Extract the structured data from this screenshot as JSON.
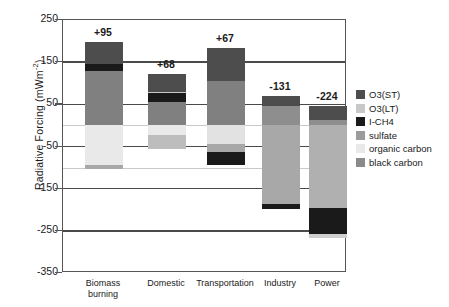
{
  "chart_data": {
    "type": "bar",
    "subtype": "stacked-bar-diverging",
    "title": "",
    "xlabel": "",
    "ylabel": "Radiative Forcing (mWm-2)",
    "ylabel_base": "Radiative Forcing (mWm",
    "ylabel_sup": "-2",
    "ylabel_close": ")",
    "ylim": [
      -350,
      250
    ],
    "yticks": [
      250,
      150,
      50,
      -50,
      -150,
      -250,
      -350
    ],
    "ytick_labels": [
      "250",
      "150",
      "50",
      "-50",
      "-150",
      "-250",
      "-350"
    ],
    "grid": "horizontal-major-and-minor",
    "legend_position": "right",
    "categories": [
      "Biomass burning",
      "Domestic",
      "Transportation",
      "Industry",
      "Power"
    ],
    "category_labels_line1": [
      "Biomass",
      "Domestic",
      "Transportation",
      "Industry",
      "Power"
    ],
    "category_labels_line2": [
      "burning",
      "",
      "",
      "",
      ""
    ],
    "net_labels": [
      "+95",
      "+68",
      "+67",
      "-131",
      "-224"
    ],
    "net_values": [
      95,
      68,
      67,
      -131,
      -224
    ],
    "series": [
      {
        "name": "O3(ST)",
        "color": "#4d4d4d",
        "values": [
          52,
          44,
          77,
          25,
          35
        ]
      },
      {
        "name": "O3(LT)",
        "color": "#c8c8c8",
        "values": [
          0,
          4,
          0,
          0,
          0
        ]
      },
      {
        "name": "I-CH4",
        "color": "#1a1a1a",
        "values": [
          17,
          22,
          -50,
          -9,
          -64
        ]
      },
      {
        "name": "sulfate",
        "color": "#9b9b9b",
        "values": [
          0,
          0,
          -18,
          -168,
          -200
        ]
      },
      {
        "name": "organic carbon",
        "color": "#e2e2e2",
        "values": [
          -105,
          -55,
          -45,
          0,
          -10
        ]
      },
      {
        "name": "black carbon",
        "color": "#808080",
        "values": [
          131,
          53,
          103,
          21,
          15
        ]
      }
    ],
    "legend_entries": [
      {
        "label": "O3(ST)",
        "color": "#4d4d4d"
      },
      {
        "label": "O3(LT)",
        "color": "#c8c8c8"
      },
      {
        "label": "I-CH4",
        "color": "#1a1a1a"
      },
      {
        "label": "sulfate",
        "color": "#9b9b9b"
      },
      {
        "label": "organic carbon",
        "color": "#e9e9e9"
      },
      {
        "label": "black carbon",
        "color": "#8a8a8a"
      }
    ],
    "bars": [
      {
        "category": "Biomass burning",
        "net_label": "+95",
        "pos_segments": [
          {
            "name": "black carbon",
            "color": "#808080",
            "from": 0,
            "to": 128
          },
          {
            "name": "I-CH4",
            "color": "#1a1a1a",
            "from": 128,
            "to": 145
          },
          {
            "name": "O3(ST)",
            "color": "#4d4d4d",
            "from": 145,
            "to": 198
          }
        ],
        "neg_segments": [
          {
            "name": "organic carbon",
            "color": "#e9e9e9",
            "from": 0,
            "to": -95
          },
          {
            "name": "sulfate",
            "color": "#a8a8a8",
            "from": -95,
            "to": -103
          }
        ]
      },
      {
        "category": "Domestic",
        "net_label": "+68",
        "pos_segments": [
          {
            "name": "black carbon",
            "color": "#808080",
            "from": 0,
            "to": 55
          },
          {
            "name": "I-CH4",
            "color": "#1a1a1a",
            "from": 55,
            "to": 76
          },
          {
            "name": "O3(LT)",
            "color": "#c8c8c8",
            "from": 76,
            "to": 80
          },
          {
            "name": "O3(ST)",
            "color": "#4d4d4d",
            "from": 80,
            "to": 123
          }
        ],
        "neg_segments": [
          {
            "name": "organic carbon",
            "color": "#e9e9e9",
            "from": 0,
            "to": -22
          },
          {
            "name": "sulfate",
            "color": "#bdbdbd",
            "from": -22,
            "to": -55
          }
        ]
      },
      {
        "category": "Transportation",
        "net_label": "+67",
        "pos_segments": [
          {
            "name": "black carbon",
            "color": "#808080",
            "from": 0,
            "to": 106
          },
          {
            "name": "O3(ST)",
            "color": "#4d4d4d",
            "from": 106,
            "to": 183
          }
        ],
        "neg_segments": [
          {
            "name": "organic carbon",
            "color": "#e2e2e2",
            "from": 0,
            "to": -45
          },
          {
            "name": "sulfate",
            "color": "#a8a8a8",
            "from": -45,
            "to": -62
          },
          {
            "name": "I-CH4",
            "color": "#1a1a1a",
            "from": -62,
            "to": -95
          }
        ]
      },
      {
        "category": "Industry",
        "net_label": "-131",
        "pos_segments": [
          {
            "name": "black carbon",
            "color": "#8e8e8e",
            "from": 0,
            "to": 47
          },
          {
            "name": "O3(ST)",
            "color": "#4d4d4d",
            "from": 47,
            "to": 70
          }
        ],
        "neg_segments": [
          {
            "name": "sulfate",
            "color": "#a8a8a8",
            "from": 0,
            "to": -186
          },
          {
            "name": "I-CH4",
            "color": "#1a1a1a",
            "from": -186,
            "to": -198
          }
        ]
      },
      {
        "category": "Power",
        "net_label": "-224",
        "pos_segments": [
          {
            "name": "black carbon",
            "color": "#8e8e8e",
            "from": 0,
            "to": 12
          },
          {
            "name": "O3(ST)",
            "color": "#4d4d4d",
            "from": 12,
            "to": 46
          }
        ],
        "neg_segments": [
          {
            "name": "sulfate",
            "color": "#b0b0b0",
            "from": 0,
            "to": -196
          },
          {
            "name": "I-CH4",
            "color": "#1a1a1a",
            "from": -196,
            "to": -258
          },
          {
            "name": "organic carbon",
            "color": "#cfcfcf",
            "from": -258,
            "to": -268
          }
        ]
      }
    ]
  }
}
